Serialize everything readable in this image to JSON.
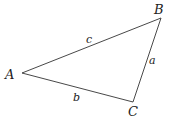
{
  "diagram": {
    "type": "triangle",
    "stroke_color": "#333333",
    "text_color": "#222222",
    "vertices": [
      {
        "id": "A",
        "label": "A",
        "x": 22,
        "y": 73,
        "label_x": 5,
        "label_y": 79
      },
      {
        "id": "B",
        "label": "B",
        "x": 161,
        "y": 18,
        "label_x": 154,
        "label_y": 14
      },
      {
        "id": "C",
        "label": "C",
        "x": 133,
        "y": 102,
        "label_x": 128,
        "label_y": 116
      }
    ],
    "sides": [
      {
        "id": "c",
        "label": "c",
        "from": "A",
        "to": "B",
        "label_x": 86,
        "label_y": 43
      },
      {
        "id": "a",
        "label": "a",
        "from": "B",
        "to": "C",
        "label_x": 149,
        "label_y": 64
      },
      {
        "id": "b",
        "label": "b",
        "from": "A",
        "to": "C",
        "label_x": 73,
        "label_y": 101
      }
    ]
  }
}
